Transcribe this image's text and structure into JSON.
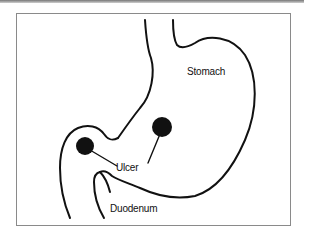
{
  "figure": {
    "labels": {
      "stomach": "Stomach",
      "ulcer": "Ulcer",
      "duodenum": "Duodenum"
    },
    "ulcers": [
      {
        "name": "duodenal-ulcer",
        "cx": 85,
        "cy": 146,
        "r": 9
      },
      {
        "name": "gastric-ulcer",
        "cx": 162,
        "cy": 127,
        "r": 10
      }
    ],
    "colors": {
      "outline": "#111111",
      "frame": "#8a8a8a",
      "background": "#ffffff"
    }
  }
}
